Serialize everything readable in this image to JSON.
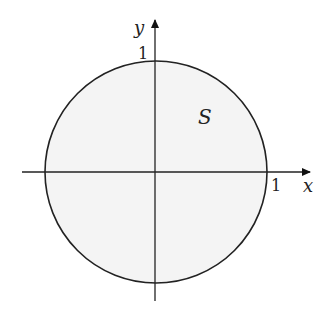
{
  "diagram": {
    "region_label": "S",
    "x_axis_label": "x",
    "y_axis_label": "y",
    "x_tick_label": "1",
    "y_tick_label": "1",
    "colors": {
      "region_fill": "#f4f4f4",
      "stroke": "#222222"
    }
  }
}
